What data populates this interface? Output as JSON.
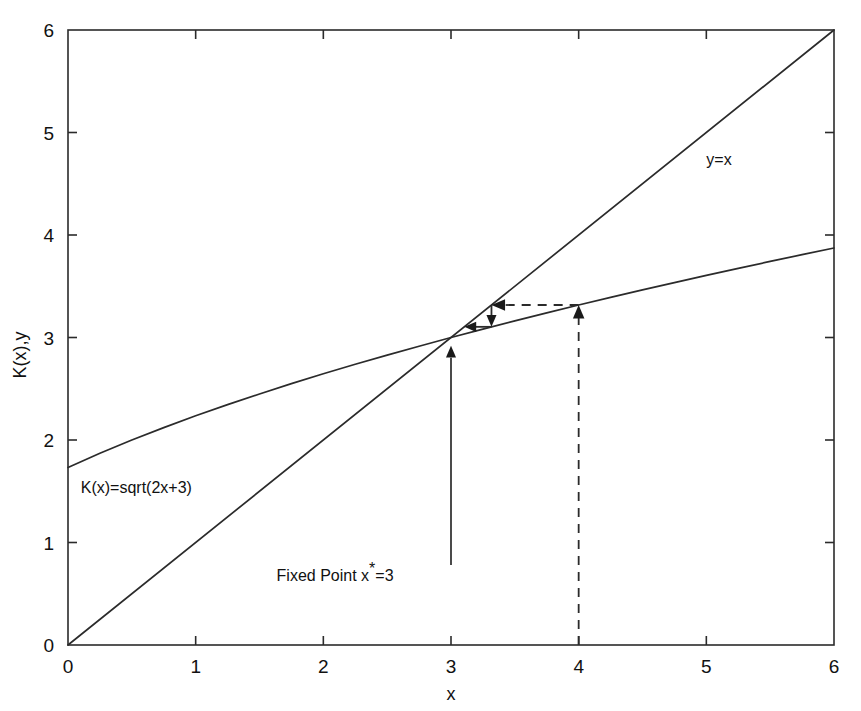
{
  "chart_data": {
    "type": "line",
    "title": "",
    "xlabel": "x",
    "ylabel": "K(x),y",
    "xlim": [
      0,
      6
    ],
    "ylim": [
      0,
      6
    ],
    "grid": false,
    "legend_position": "inline-labels",
    "x_ticks": [
      "0",
      "1",
      "2",
      "3",
      "4",
      "5",
      "6"
    ],
    "y_ticks": [
      "0",
      "1",
      "2",
      "3",
      "4",
      "5",
      "6"
    ],
    "x_tick_values": [
      0,
      1,
      2,
      3,
      4,
      5,
      6
    ],
    "y_tick_values": [
      0,
      1,
      2,
      3,
      4,
      5,
      6
    ],
    "series": [
      {
        "name": "K(x)=sqrt(2x+3)",
        "label": "K(x)=sqrt(2x+3)",
        "x": [
          0,
          0.25,
          0.5,
          0.75,
          1,
          1.25,
          1.5,
          1.75,
          2,
          2.25,
          2.5,
          2.75,
          3,
          3.25,
          3.5,
          3.75,
          4,
          4.25,
          4.5,
          4.75,
          5,
          5.25,
          5.5,
          5.75,
          6
        ],
        "values": [
          1.732,
          1.871,
          2.0,
          2.121,
          2.236,
          2.345,
          2.449,
          2.55,
          2.646,
          2.739,
          2.828,
          2.915,
          3.0,
          3.082,
          3.162,
          3.24,
          3.317,
          3.391,
          3.464,
          3.536,
          3.606,
          3.674,
          3.742,
          3.808,
          3.873
        ]
      },
      {
        "name": "y=x",
        "label": "y=x",
        "x": [
          0,
          6
        ],
        "values": [
          0,
          6
        ]
      }
    ],
    "annotations": [
      {
        "name": "fixed-point-label",
        "text": "Fixed Point x",
        "superscript": "*",
        "text_suffix": "=3",
        "x": 2.55,
        "y": 0.62
      },
      {
        "name": "curve-label-k",
        "text": "K(x)=sqrt(2x+3)",
        "x": 0.1,
        "y": 1.48
      },
      {
        "name": "curve-label-identity",
        "text": "y=x",
        "x": 5.0,
        "y": 4.68
      }
    ],
    "cobweb": {
      "description": "Fixed point iteration cobweb converging to x*=3 starting from x0=4",
      "start_x": 4,
      "fixed_point": 3,
      "steps": [
        {
          "type": "vertical-dashed-up",
          "x": 4,
          "y_from": 0,
          "y_to": 3.317,
          "arrow": "up"
        },
        {
          "type": "horizontal-dashed-left",
          "y": 3.317,
          "x_from": 4,
          "x_to": 3.317,
          "arrow": "left"
        },
        {
          "type": "vertical-solid-down",
          "x": 3.317,
          "y_from": 3.317,
          "y_to": 3.104,
          "arrow": "down"
        },
        {
          "type": "horizontal-solid-left",
          "y": 3.104,
          "x_from": 3.317,
          "x_to": 3.104,
          "arrow": "left"
        }
      ]
    },
    "fixed_point_pointer": {
      "x": 3,
      "y_from": 0.78,
      "y_to": 2.92,
      "arrow": "up"
    }
  }
}
